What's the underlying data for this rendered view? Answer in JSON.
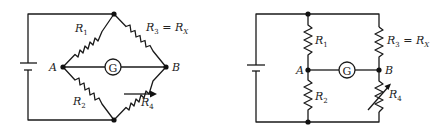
{
  "figure": {
    "left_diagram": {
      "layout": "diamond",
      "labels": {
        "r1": "R",
        "r1_sub": "1",
        "r2": "R",
        "r2_sub": "2",
        "r3": "R",
        "r3_sub": "3",
        "r3_eq": " = R",
        "r3_eq_sub": "X",
        "r4": "R",
        "r4_sub": "4",
        "node_a": "A",
        "node_b": "B",
        "galvanometer": "G"
      }
    },
    "right_diagram": {
      "layout": "rectangular",
      "labels": {
        "r1": "R",
        "r1_sub": "1",
        "r2": "R",
        "r2_sub": "2",
        "r3": "R",
        "r3_sub": "3",
        "r3_eq": " = R",
        "r3_eq_sub": "X",
        "r4": "R",
        "r4_sub": "4",
        "node_a": "A",
        "node_b": "B",
        "galvanometer": "G"
      }
    },
    "colors": {
      "line": "#1a1a1a",
      "background": "#ffffff"
    }
  }
}
